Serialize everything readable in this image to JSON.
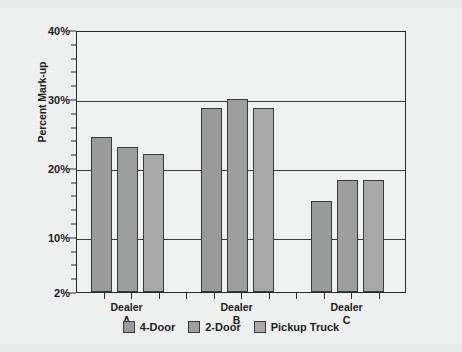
{
  "chart_data": {
    "type": "bar",
    "title": "",
    "xlabel": "",
    "ylabel": "Percent Mark-up",
    "ylim": [
      2,
      40
    ],
    "ytick_labels": [
      "40%",
      "30%",
      "20%",
      "10%",
      "2%"
    ],
    "ytick_values": [
      40,
      30,
      20,
      10,
      2
    ],
    "minor_tick_step": 2,
    "grid": "horizontal",
    "legend_position": "bottom",
    "categories": [
      "Dealer A",
      "Dealer B",
      "Dealer C"
    ],
    "category_lines": [
      [
        "Dealer",
        "A"
      ],
      [
        "Dealer",
        "B"
      ],
      [
        "Dealer",
        "C"
      ]
    ],
    "series": [
      {
        "name": "4-Door",
        "color": "#9a9a9a",
        "values": [
          24.5,
          28.7,
          15.2
        ]
      },
      {
        "name": "2-Door",
        "color": "#9e9e9e",
        "values": [
          23.0,
          30.0,
          18.3
        ]
      },
      {
        "name": "Pickup Truck",
        "color": "#a8a8a8",
        "values": [
          22.0,
          28.7,
          18.3
        ]
      }
    ]
  },
  "legend": {
    "items": [
      {
        "label": "4-Door",
        "color": "#9a9a9a"
      },
      {
        "label": "2-Door",
        "color": "#9e9e9e"
      },
      {
        "label": "Pickup Truck",
        "color": "#a8a8a8"
      }
    ]
  },
  "colors": {
    "page_background": "#e9eaea",
    "card_background": "#eeefef",
    "plot_background": "#f0f1f1",
    "axis": "#2a2a2a",
    "gridline": "#3b3b3b",
    "text": "#1d1d1d",
    "bar_outline": "#3a3a3a"
  }
}
